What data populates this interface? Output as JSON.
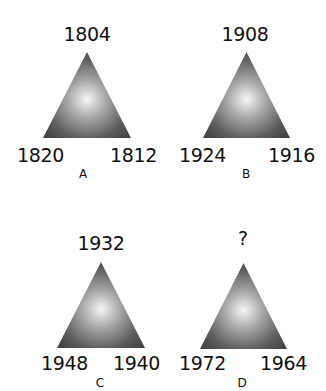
{
  "puzzle": {
    "panels": [
      {
        "label": "A",
        "top": "1804",
        "bottom_left": "1820",
        "bottom_right": "1812"
      },
      {
        "label": "B",
        "top": "1908",
        "bottom_left": "1924",
        "bottom_right": "1916"
      },
      {
        "label": "C",
        "top": "1932",
        "bottom_left": "1948",
        "bottom_right": "1940"
      },
      {
        "label": "D",
        "top": "?",
        "bottom_left": "1972",
        "bottom_right": "1964"
      }
    ]
  },
  "colors": {
    "triangle_center": "#f4f4f4",
    "triangle_edge": "#4a4a4a",
    "text": "#111111"
  }
}
